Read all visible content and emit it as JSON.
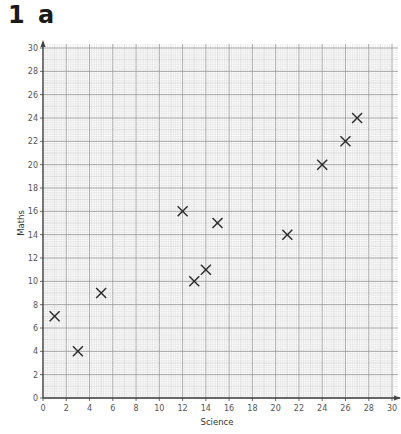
{
  "heading": {
    "number": "1",
    "part": "a"
  },
  "colors": {
    "grid_minor": "#d4d4d4",
    "grid_major": "#9a9a9a",
    "axis": "#444444",
    "marker": "#2a2a2a",
    "text": "#555555"
  },
  "chart_data": {
    "type": "scatter",
    "title": "",
    "xlabel": "Science",
    "ylabel": "Maths",
    "xlim": [
      0,
      30
    ],
    "ylim": [
      0,
      30
    ],
    "xticks": [
      0,
      2,
      4,
      6,
      8,
      10,
      12,
      14,
      16,
      18,
      20,
      22,
      24,
      26,
      28,
      30
    ],
    "yticks": [
      0,
      2,
      4,
      6,
      8,
      10,
      12,
      14,
      16,
      18,
      20,
      22,
      24,
      26,
      28,
      30
    ],
    "grid": true,
    "marker": "x",
    "series": [
      {
        "name": "Students",
        "points": [
          {
            "x": 1,
            "y": 7
          },
          {
            "x": 3,
            "y": 4
          },
          {
            "x": 5,
            "y": 9
          },
          {
            "x": 12,
            "y": 16
          },
          {
            "x": 13,
            "y": 10
          },
          {
            "x": 14,
            "y": 11
          },
          {
            "x": 15,
            "y": 15
          },
          {
            "x": 21,
            "y": 14
          },
          {
            "x": 24,
            "y": 20
          },
          {
            "x": 26,
            "y": 22
          },
          {
            "x": 27,
            "y": 24
          }
        ]
      }
    ]
  }
}
